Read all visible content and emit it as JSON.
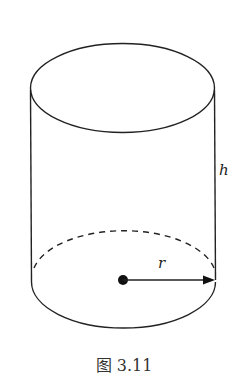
{
  "figure": {
    "caption": "图 3.11",
    "labels": {
      "height": "h",
      "radius": "r"
    },
    "shape": "cylinder",
    "stroke_color": "#222222"
  }
}
